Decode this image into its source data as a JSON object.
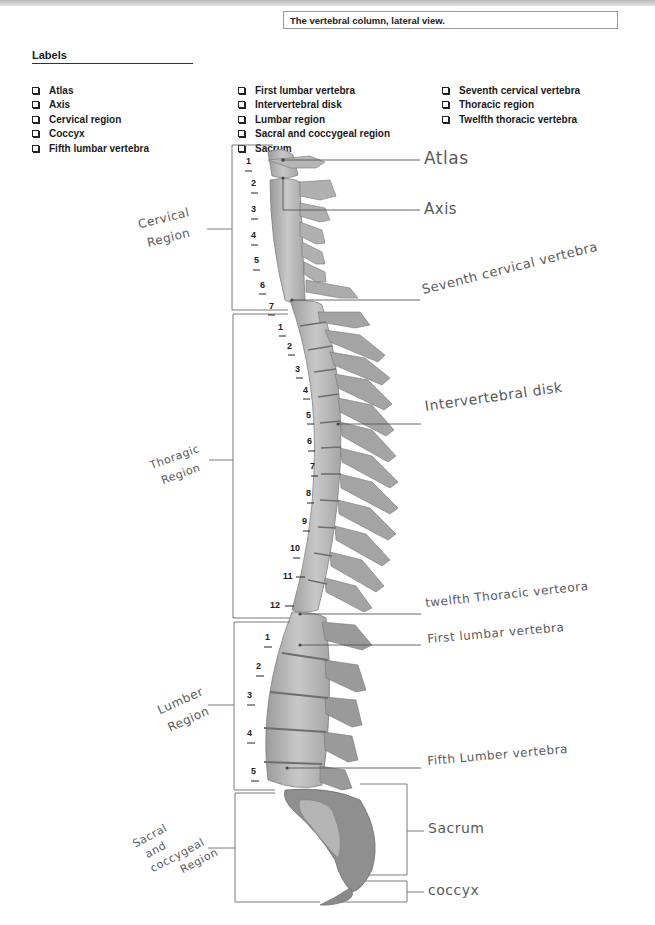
{
  "caption": "The vertebral column, lateral view.",
  "labels_heading": "Labels",
  "label_columns": [
    [
      "Atlas",
      "Axis",
      "Cervical region",
      "Coccyx",
      "Fifth lumbar vertebra"
    ],
    [
      "First lumbar vertebra",
      "Intervertebral disk",
      "Lumbar region",
      "Sacral and coccygeal region",
      "Sacrum"
    ],
    [
      "Seventh cervical vertebra",
      "Thoracic region",
      "Twelfth thoracic vertebra"
    ]
  ],
  "diagram": {
    "handwritten_right": {
      "atlas": "Atlas",
      "axis": "Axis",
      "seventh_cervical": "Seventh cervical vertebra",
      "intervertebral_disk": "Intervertebral disk",
      "twelfth_thoracic": "twelfth Thoracic verteora",
      "first_lumbar": "First lumbar vertebra",
      "fifth_lumbar": "Fifth Lumber vertebra",
      "sacrum": "Sacrum",
      "coccyx": "coccyx"
    },
    "handwritten_left": {
      "cervical": [
        "Cervical",
        "Region"
      ],
      "thoracic": [
        "Thoragic",
        "Region"
      ],
      "lumbar": [
        "Lumber",
        "Region"
      ],
      "sacral": [
        "Sacral",
        "and",
        "coccygeal",
        "Region"
      ]
    },
    "cervical_numbers": [
      "1",
      "2",
      "3",
      "4",
      "5",
      "6",
      "7"
    ],
    "thoracic_numbers": [
      "1",
      "2",
      "3",
      "4",
      "5",
      "6",
      "7",
      "8",
      "9",
      "10",
      "11",
      "12"
    ],
    "lumbar_numbers": [
      "1",
      "2",
      "3",
      "4",
      "5"
    ],
    "colors": {
      "bone": "#b9b9b9",
      "bone_dark": "#8a8a8a",
      "line": "#777777",
      "ink": "#555555"
    }
  }
}
